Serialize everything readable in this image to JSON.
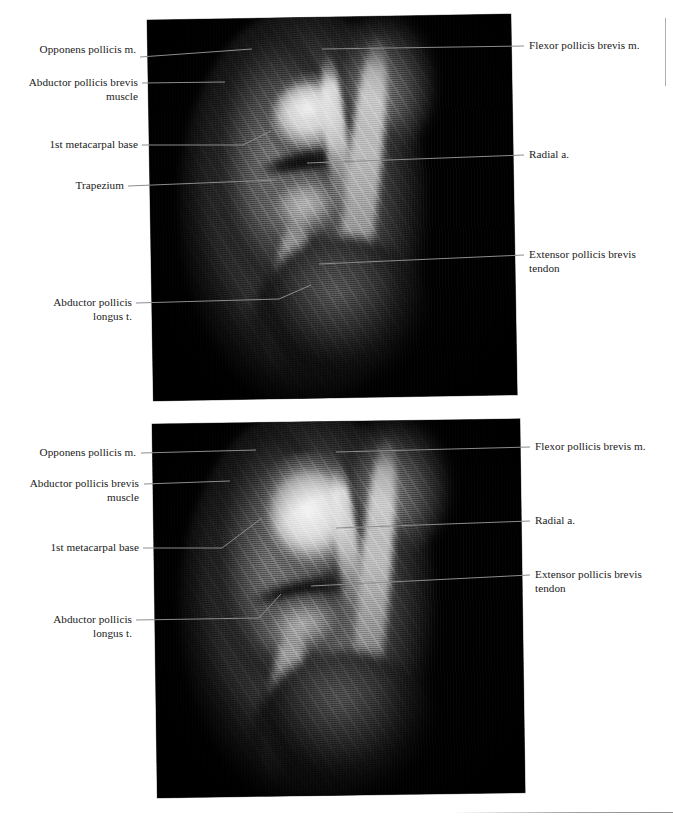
{
  "page": {
    "background_color": "#ffffff",
    "text_color": "#1a1a1a",
    "leader_color": "#8c8c8c",
    "panel_background": "#000000"
  },
  "figure": {
    "type": "anatomical-mri-plate",
    "modality": "MRI",
    "region": "thumb / first carpometacarpal joint",
    "panel_count": 2
  },
  "panels": [
    {
      "id": "panel-top",
      "labels_left": [
        {
          "key": "opponens-pollicis-m",
          "text": "Opponens pollicis m."
        },
        {
          "key": "abductor-pollicis-brevis",
          "text": "Abductor pollicis brevis\nmuscle"
        },
        {
          "key": "first-metacarpal-base",
          "text": "1st metacarpal base"
        },
        {
          "key": "trapezium",
          "text": "Trapezium"
        },
        {
          "key": "abductor-pollicis-longus",
          "text": "Abductor pollicis\nlongus t."
        }
      ],
      "labels_right": [
        {
          "key": "flexor-pollicis-brevis-m",
          "text": "Flexor pollicis brevis m."
        },
        {
          "key": "radial-a",
          "text": "Radial a."
        },
        {
          "key": "extensor-pollicis-brevis-t",
          "text": "Extensor pollicis brevis\ntendon"
        }
      ]
    },
    {
      "id": "panel-bottom",
      "labels_left": [
        {
          "key": "opponens-pollicis-m",
          "text": "Opponens pollicis m."
        },
        {
          "key": "abductor-pollicis-brevis",
          "text": "Abductor pollicis brevis\nmuscle"
        },
        {
          "key": "first-metacarpal-base",
          "text": "1st metacarpal base"
        },
        {
          "key": "abductor-pollicis-longus",
          "text": "Abductor pollicis\nlongus t."
        }
      ],
      "labels_right": [
        {
          "key": "flexor-pollicis-brevis-m",
          "text": "Flexor pollicis brevis m."
        },
        {
          "key": "radial-a",
          "text": "Radial a."
        },
        {
          "key": "extensor-pollicis-brevis-t",
          "text": "Extensor pollicis brevis\ntendon"
        }
      ]
    }
  ]
}
